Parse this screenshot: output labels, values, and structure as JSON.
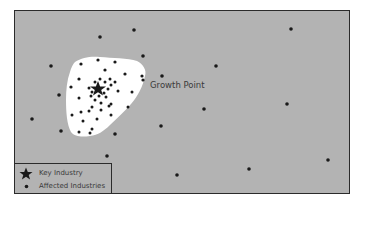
{
  "diagram": {
    "label": "Growth Point",
    "colors": {
      "background": "#b3b3b3",
      "border": "#2b2b2b",
      "growth_area": "#ffffff",
      "dot": "#1a1a1a"
    },
    "key_industry": {
      "x": 98,
      "y": 89
    },
    "legend": {
      "items": [
        {
          "icon": "star-icon",
          "label": "Key Industry"
        },
        {
          "icon": "dot-icon",
          "label": "Affected Industries"
        }
      ]
    }
  }
}
